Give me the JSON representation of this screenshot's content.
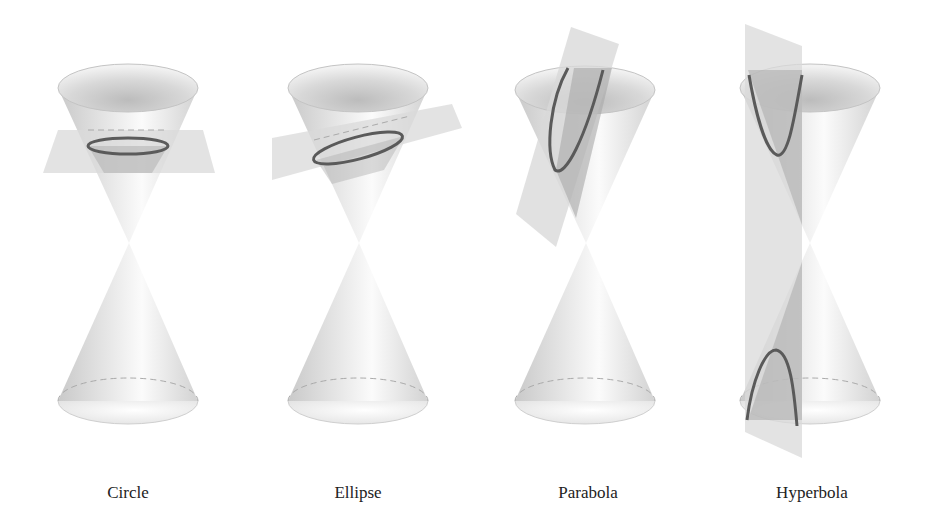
{
  "figure": {
    "panels": [
      {
        "id": "circle",
        "label": "Circle",
        "cx": 128,
        "section": "horizontal plane"
      },
      {
        "id": "ellipse",
        "label": "Ellipse",
        "cx": 358,
        "section": "tilted plane"
      },
      {
        "id": "parabola",
        "label": "Parabola",
        "cx": 588,
        "section": "plane parallel to side"
      },
      {
        "id": "hyperbola",
        "label": "Hyperbola",
        "cx": 812,
        "section": "vertical plane cutting both nappes"
      }
    ]
  },
  "colors": {
    "background": "#ffffff",
    "cone_light": "#f4f4f4",
    "cone_mid": "#d8d8d8",
    "cone_dark": "#b8b8b8",
    "plane": "#d9d9d9",
    "plane_dark": "#a9a9a9",
    "curve": "#5a5a5a"
  }
}
